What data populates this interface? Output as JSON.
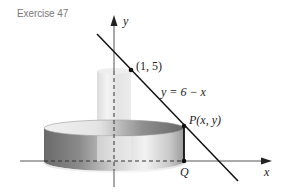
{
  "exercise": {
    "title": "Exercise 47"
  },
  "diagram": {
    "axes": {
      "x_label": "x",
      "y_label": "y"
    },
    "line": {
      "equation": "y = 6 − x"
    },
    "points": {
      "top_point": "(1, 5)",
      "p_label": "P(x, y)",
      "q_label": "Q"
    },
    "colors": {
      "line": "#111111",
      "axis": "#555555",
      "shell_dark": "#6f6f6f",
      "shell_light": "#e8e8e8",
      "inner_cylinder": "#e6e6e6"
    }
  }
}
